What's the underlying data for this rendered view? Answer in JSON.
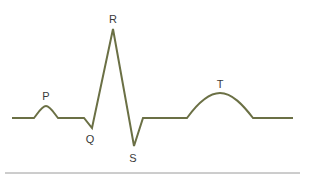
{
  "diagram": {
    "line_color": "#6b7045",
    "rule_color": "#9a9a9a",
    "labels": {
      "p": "P",
      "q": "Q",
      "r": "R",
      "s": "S",
      "t": "T"
    }
  }
}
